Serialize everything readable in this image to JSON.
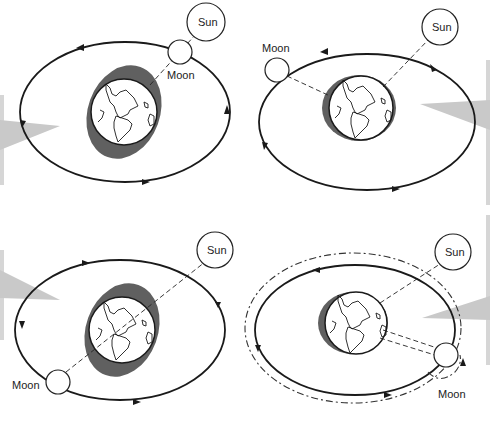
{
  "diagram": {
    "colors": {
      "orbit": "#1a1a1a",
      "shadow_bulge": "#606060",
      "pointer": "#c9c9c9",
      "background": "#ffffff"
    },
    "panels": [
      {
        "id": "top-left",
        "sun_label": "Sun",
        "moon_label": "Moon",
        "configuration": "Moon between Earth and Sun (aligned)"
      },
      {
        "id": "top-right",
        "sun_label": "Sun",
        "moon_label": "Moon",
        "configuration": "Moon at right angle to Sun"
      },
      {
        "id": "bottom-left",
        "sun_label": "Sun",
        "moon_label": "Moon",
        "configuration": "Moon opposite the Sun (aligned)"
      },
      {
        "id": "bottom-right",
        "sun_label": "Sun",
        "moon_label": "Moon",
        "configuration": "Moon at right angle with perturbed (dashed) orbit"
      }
    ]
  }
}
